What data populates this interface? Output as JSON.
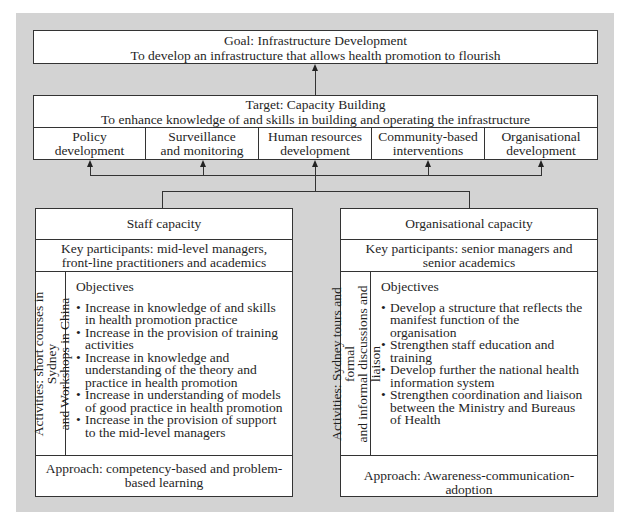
{
  "goal": {
    "title": "Goal: Infrastructure Development",
    "subtitle": "To develop an infrastructure that allows health promotion to flourish"
  },
  "target": {
    "title": "Target: Capacity Building",
    "subtitle": "To enhance knowledge of and skills in building and operating the infrastructure",
    "areas": [
      {
        "line1": "Policy",
        "line2": "development"
      },
      {
        "line1": "Surveillance",
        "line2": "and monitoring"
      },
      {
        "line1": "Human resources",
        "line2": "development"
      },
      {
        "line1": "Community-based",
        "line2": "interventions"
      },
      {
        "line1": "Organisational",
        "line2": "development"
      }
    ]
  },
  "staff_capacity": {
    "title": "Staff capacity",
    "key_participants_1": "Key participants: mid-level managers,",
    "key_participants_2": "front-line practitioners and academics",
    "activities_1": "Activities: short courses in Sydney",
    "activities_2": "and Workshops in China",
    "objectives_heading": "Objectives",
    "objectives": [
      "Increase in knowledge of and skills in health promotion practice",
      "Increase in the provision of training activities",
      "Increase in knowledge and understanding of the theory and practice in health promotion",
      "Increase in understanding of models of good practice in health promotion",
      "Increase in the provision of support to the mid-level managers"
    ],
    "approach": "Approach: competency-based and problem-based learning"
  },
  "organisational_capacity": {
    "title": "Organisational capacity",
    "key_participants_1": "Key participants: senior managers and",
    "key_participants_2": "senior academics",
    "activities_1": "Activities: Sydney tours and formal",
    "activities_2": "and informal discussions and liaison",
    "objectives_heading": "Objectives",
    "objectives": [
      "Develop a structure that reflects the manifest function of the organisation",
      "Strengthen staff education and training",
      "Develop further the national health information system",
      "Strengthen coordination and liaison between the Ministry and Bureaus of Health"
    ],
    "approach": "Approach: Awareness-communication-adoption"
  }
}
